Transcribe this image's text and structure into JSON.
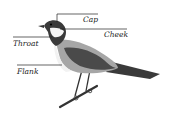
{
  "diagram": {
    "labels": {
      "cap": "Cap",
      "cheek": "Cheek",
      "throat": "Throat",
      "flank": "Flank"
    },
    "colors": {
      "background": "#ffffff",
      "dark": "#3a3a3a",
      "mid": "#a0a0a0",
      "light": "#f2f2f2",
      "line": "#222222"
    }
  }
}
